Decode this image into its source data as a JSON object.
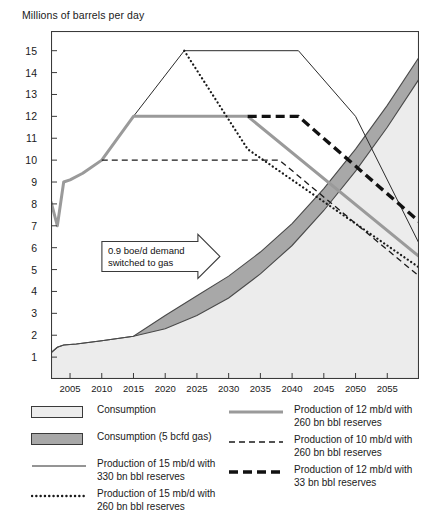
{
  "chart_data": {
    "type": "line",
    "title": "Millions of barrels per day",
    "xlabel": "",
    "ylabel": "Millions of barrels per day",
    "xlim": [
      2002,
      2060
    ],
    "ylim": [
      0,
      15.9
    ],
    "grid": false,
    "legend_position": "bottom",
    "xticks": [
      2005,
      2010,
      2015,
      2020,
      2025,
      2030,
      2035,
      2040,
      2045,
      2050,
      2055
    ],
    "yticks": [
      1,
      2,
      3,
      4,
      5,
      6,
      7,
      8,
      9,
      10,
      11,
      12,
      13,
      14,
      15
    ],
    "annotations": [
      {
        "text_line1": "0.9 boe/d demand",
        "text_line2": "switched to gas",
        "x": 2022,
        "y": 5.6
      }
    ],
    "series": [
      {
        "name": "Consumption",
        "style": "area",
        "fill": "#ececec",
        "stroke": "#4a4a4a",
        "x": [
          2002,
          2003,
          2004,
          2006,
          2010,
          2015,
          2020,
          2025,
          2030,
          2035,
          2040,
          2045,
          2050,
          2055,
          2060
        ],
        "values": [
          1.2,
          1.45,
          1.55,
          1.6,
          1.75,
          1.95,
          2.3,
          2.9,
          3.7,
          4.8,
          6.1,
          7.7,
          9.5,
          11.5,
          13.7
        ]
      },
      {
        "name": "Consumption (5 bcfd gas)",
        "style": "area-band",
        "fill": "#a8a8a8",
        "stroke": "#4a4a4a",
        "x": [
          2002,
          2003,
          2004,
          2006,
          2010,
          2015,
          2020,
          2025,
          2030,
          2035,
          2040,
          2045,
          2050,
          2055,
          2060
        ],
        "values": [
          1.2,
          1.45,
          1.55,
          1.6,
          1.75,
          1.95,
          2.9,
          3.8,
          4.7,
          5.8,
          7.1,
          8.7,
          10.5,
          12.5,
          14.7
        ]
      },
      {
        "name": "Production of 15 mb/d with 330 bn bbl reserves",
        "style": "solid-thin",
        "stroke": "#2a2a2a",
        "x": [
          2002,
          2003,
          2004,
          2005,
          2007,
          2010,
          2015,
          2023,
          2041,
          2050,
          2060
        ],
        "values": [
          8.1,
          7.0,
          9.0,
          9.1,
          9.4,
          10.0,
          12.0,
          15.0,
          15.0,
          12.0,
          6.2
        ]
      },
      {
        "name": "Production of 15 mb/d with 260 bn bbl reserves",
        "style": "dotted",
        "stroke": "#1a1a1a",
        "x": [
          2023,
          2033,
          2060
        ],
        "values": [
          15.0,
          10.5,
          5.1
        ]
      },
      {
        "name": "Production of 12 mb/d with 260 bn bbl reserves",
        "style": "solid-gray",
        "stroke": "#9a9a9a",
        "x": [
          2002,
          2003,
          2004,
          2005,
          2007,
          2010,
          2015,
          2033,
          2060
        ],
        "values": [
          8.1,
          7.0,
          9.0,
          9.1,
          9.4,
          10.0,
          12.0,
          12.0,
          5.6
        ]
      },
      {
        "name": "Production of 10 mb/d with 260 bn bbl reserves",
        "style": "dashed-thin",
        "stroke": "#1a1a1a",
        "x": [
          2010,
          2038,
          2060
        ],
        "values": [
          10.0,
          10.0,
          4.7
        ]
      },
      {
        "name": "Production of 12 mb/d with 33 bn bbl reserves",
        "style": "dashed-thick",
        "stroke": "#111111",
        "x": [
          2033,
          2041,
          2060
        ],
        "values": [
          12.0,
          12.0,
          7.2
        ]
      }
    ]
  },
  "legend": {
    "items": [
      {
        "key": "swatch-light",
        "label": "Consumption",
        "column": "left"
      },
      {
        "key": "swatch-dark",
        "label": "Consumption (5 bcfd gas)",
        "column": "left"
      },
      {
        "key": "line-solid-thin",
        "label": "Production of 15 mb/d with 330 bn bbl reserves",
        "column": "left"
      },
      {
        "key": "line-dotted",
        "label": "Production of 15 mb/d with 260 bn bbl reserves",
        "column": "left"
      },
      {
        "key": "line-solid-gray",
        "label": "Production of 12 mb/d with 260 bn bbl reserves",
        "column": "right"
      },
      {
        "key": "line-dashed-thin",
        "label": "Production of 10 mb/d with 260 bn bbl reserves",
        "column": "right"
      },
      {
        "key": "line-dashed-thick",
        "label": "Production of 12 mb/d with 33 bn bbl reserves",
        "column": "right"
      }
    ]
  },
  "colors": {
    "consumption_fill": "#ececec",
    "gas_fill": "#a8a8a8",
    "band_stroke": "#4a4a4a",
    "line_dark": "#2a2a2a",
    "line_gray": "#9a9a9a",
    "frame": "#3a3a3a",
    "text": "#1a1a1a"
  }
}
